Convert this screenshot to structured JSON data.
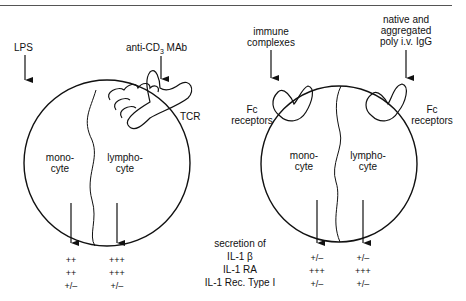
{
  "figure": {
    "left_panel": {
      "stimulus_1": "LPS",
      "stimulus_2": "anti-CD3 MAb",
      "stimulus_2_base": "anti-CD",
      "stimulus_2_sub": "3",
      "stimulus_2_tail": " MAb",
      "receptor_label": "TCR",
      "cell_left": [
        "mono-",
        "cyte"
      ],
      "cell_right": [
        "lympho-",
        "cyte"
      ],
      "monocyte_values": [
        "++",
        "++",
        "+/–"
      ],
      "lymphocyte_values": [
        "+++",
        "+++",
        "+/–"
      ]
    },
    "right_panel": {
      "stimulus_1": [
        "immune",
        "complexes"
      ],
      "stimulus_2": [
        "native and",
        "aggregated",
        "poly i.v. IgG"
      ],
      "receptor_left": [
        "Fc",
        "receptors"
      ],
      "receptor_right": [
        "Fc",
        "receptors"
      ],
      "cell_left": [
        "mono-",
        "cyte"
      ],
      "cell_right": [
        "lympho-",
        "cyte"
      ],
      "monocyte_values": [
        "+/–",
        "+++",
        "+/–"
      ],
      "lymphocyte_values": [
        "+/–",
        "+++",
        "+/–"
      ]
    },
    "center_legend": {
      "title": "secretion of",
      "rows": [
        "IL-1 β",
        "IL-1 RA",
        "IL-1 Rec. Type I"
      ]
    }
  }
}
